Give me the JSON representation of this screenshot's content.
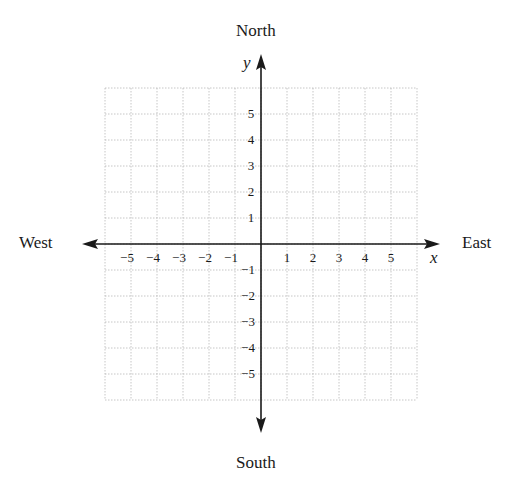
{
  "directions": {
    "north": "North",
    "south": "South",
    "east": "East",
    "west": "West"
  },
  "axes": {
    "x_label": "x",
    "y_label": "y"
  },
  "grid": {
    "x_range": [
      -6,
      6
    ],
    "y_range": [
      -6,
      6
    ],
    "cell_px": 26,
    "origin_px": [
      261,
      244
    ],
    "line_color": "#b8b8b8",
    "axis_color": "#1a1a1a",
    "line_style": "dotted"
  },
  "x_ticks": [
    "−5",
    "−4",
    "−3",
    "−2",
    "−1",
    "1",
    "2",
    "3",
    "4",
    "5"
  ],
  "x_tick_values": [
    -5,
    -4,
    -3,
    -2,
    -1,
    1,
    2,
    3,
    4,
    5
  ],
  "y_ticks": [
    "5",
    "4",
    "3",
    "2",
    "1",
    "−1",
    "−2",
    "−3",
    "−4",
    "−5"
  ],
  "y_tick_values": [
    5,
    4,
    3,
    2,
    1,
    -1,
    -2,
    -3,
    -4,
    -5
  ],
  "chart_data": {
    "type": "table",
    "title": "",
    "xlabel": "x",
    "ylabel": "y",
    "xlim": [
      -6,
      6
    ],
    "ylim": [
      -6,
      6
    ],
    "x_tick_labels": [
      -5,
      -4,
      -3,
      -2,
      -1,
      1,
      2,
      3,
      4,
      5
    ],
    "y_tick_labels": [
      5,
      4,
      3,
      2,
      1,
      -1,
      -2,
      -3,
      -4,
      -5
    ],
    "grid": true,
    "annotations": [
      "North",
      "South",
      "East",
      "West"
    ],
    "series": []
  }
}
